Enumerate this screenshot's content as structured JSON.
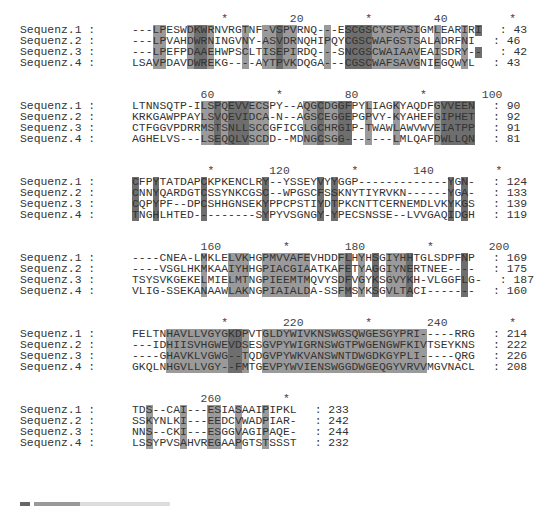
{
  "shade_colors": {
    "light": "#9a9a9a",
    "dark": "#6e6e6e"
  },
  "blocks": [
    {
      "ruler": "             *         20         *         40         *",
      "rows": [
        {
          "name": "Sequenz.1 :",
          "seq": "---LPESWDKWRNVRGTNF-VSPVRNQ---ESCGSCYSFASIGMLEARIRI",
          "end": ": 43"
        },
        {
          "name": "Sequenz.2 :",
          "seq": "---LPVAHDWRNINGVNY-ASVDRNQHIPQYCGSCWAFGSTSALADRFNI",
          "end": ": 46"
        },
        {
          "name": "Sequenz.3 :",
          "seq": "---LPEFPDAAEHWPSCLTISEPIRDQ---SNCGSCWAIAAVEAISDRY--",
          "end": ": 42"
        },
        {
          "name": "Sequenz.4 :",
          "seq": "LSAVPDAVDWREKG----AYTPVKDQGA---CGSCWAFSAVGNIEGQWYL",
          "end": ": 43"
        }
      ]
    },
    {
      "ruler": "          60         *         80         *        100",
      "rows": [
        {
          "name": "Sequenz.1 :",
          "seq": "LTNNSQTP-ILSPQEVVECSPY--AQGCDGGFPYLIAGKYAQDFGVVEEN",
          "end": ": 90"
        },
        {
          "name": "Sequenz.2 :",
          "seq": "KRKGAWPPAYLSVQEVIDCA-N--AGSCEGGEPGPVY-KYAHEFGIPHET",
          "end": ": 92"
        },
        {
          "name": "Sequenz.3 :",
          "seq": "CTFGGVPDRRMSTSNLLSCCGFICGLGCHRGIP-TWAWLAWVWVEIATPP",
          "end": ": 91"
        },
        {
          "name": "Sequenz.4 :",
          "seq": "AGHELVS---LSEQQLVSCDD--MDNGCSGG-------LMLQAFDWLLQN",
          "end": ": 81"
        }
      ]
    },
    {
      "ruler": "           *        120         *        140         *",
      "rows": [
        {
          "name": "Sequenz.1 :",
          "seq": "CFPYTATDAPCKPKENCLRY--YSSEYVYYGGP-------------YGN-",
          "end": ": 124"
        },
        {
          "name": "Sequenz.2 :",
          "seq": "CNNYQARDGTCSSYNKCGSC--WPGSCFSSKNYTIYRVKN------YGA-",
          "end": ": 133"
        },
        {
          "name": "Sequenz.3 :",
          "seq": "CQPYPF--DPCSHHGNSEKYPPCPSTIYDTPKCNTTCERNEMDLVKYKGS",
          "end": ": 139"
        },
        {
          "name": "Sequenz.4 :",
          "seq": "TNGHLHTED---------SYPYVSGNGY-YPECSNSSE--LVVGAQIDGH",
          "end": ": 119"
        }
      ]
    },
    {
      "ruler": "          160         *        180         *        200",
      "rows": [
        {
          "name": "Sequenz.1 :",
          "seq": "----CNEA-LMKLELVKHGPMVVAFEVHDDFLHYHSGIYHHTGLSDPFNP",
          "end": ": 169"
        },
        {
          "name": "Sequenz.2 :",
          "seq": "----VSGLHKMKAAIYHHGPIACGIAATKAFETYAGGIYNERTNEE----",
          "end": ": 175"
        },
        {
          "name": "Sequenz.3 :",
          "seq": "TSYSVKGEKELMIELMTNGPIEEMTMQVYSDFVGYKSGVYKH-VLGGFLG-",
          "end": ": 187"
        },
        {
          "name": "Sequenz.4 :",
          "seq": "VLIG-SSEKANAAWLAKNGPIAIALDA-SSFMSYKSGVLTACI-------",
          "end": ": 160"
        }
      ]
    },
    {
      "ruler": "             *        220         *        240         *",
      "rows": [
        {
          "name": "Sequenz.1 :",
          "seq": "FELTNHAVLLVGYGKDPVTGLDYWIVKNSWGSQWGESGYPRI-----RRG",
          "end": ": 214"
        },
        {
          "name": "Sequenz.2 :",
          "seq": "---IDHIISVHGWEVDSESGVPYWIGRNSWGTPWGENGWFKIVTSEYKNS",
          "end": ": 222"
        },
        {
          "name": "Sequenz.3 :",
          "seq": "----GHAVKLVGWG--TQDGVPYWKVANSWNTDWGDKGYPLI-----QRG",
          "end": ": 226"
        },
        {
          "name": "Sequenz.4 :",
          "seq": "GKQLNHGVLLVGY--FMTGEVPYWVIENSWGGDWGEQGYVRVVMGVNACL",
          "end": ": 208"
        }
      ]
    },
    {
      "ruler": "          260         *",
      "rows": [
        {
          "name": "Sequenz.1 :",
          "seq": "TDS--CAI---ESIASAAIPIPKL",
          "end": ": 233"
        },
        {
          "name": "Sequenz.2 :",
          "seq": "SSKYNLKI---EEDCVWADPIAR-",
          "end": ": 242"
        },
        {
          "name": "Sequenz.3 :",
          "seq": "NNS--CKI---ESGGVAGIPAQE-",
          "end": ": 244"
        },
        {
          "name": "Sequenz.4 :",
          "seq": "LSSYPVSAHVREGAAPGTSTSSST",
          "end": ": 232"
        }
      ]
    }
  ],
  "shading": [
    {
      "block": 0,
      "cols": {
        "light": [
          3,
          4,
          8,
          11,
          16,
          19,
          20,
          22,
          23,
          28,
          35,
          36,
          37,
          38,
          39,
          40,
          41,
          44,
          48
        ],
        "dark": [
          9,
          10,
          21,
          31,
          32,
          33,
          34,
          50
        ]
      }
    },
    {
      "block": 1,
      "cols": {
        "light": [
          10,
          11,
          13,
          17,
          18,
          19,
          25,
          26,
          28,
          29,
          34,
          38,
          44
        ],
        "dark": [
          12,
          14,
          15,
          16,
          27,
          30,
          31,
          45,
          46,
          47,
          48,
          49
        ]
      }
    },
    {
      "block": 2,
      "cols": {
        "light": [],
        "dark": [
          0,
          3,
          10,
          19,
          27,
          29,
          46,
          48
        ]
      }
    },
    {
      "block": 3,
      "cols": {
        "light": [
          10,
          14,
          15,
          16,
          19,
          20,
          21,
          22,
          23,
          24,
          25,
          30,
          33,
          37,
          38,
          39
        ],
        "dark": [
          31,
          35,
          40,
          48
        ]
      }
    },
    {
      "block": 4,
      "cols": {
        "light": [
          5,
          6,
          7,
          8,
          9,
          10,
          11,
          12,
          13,
          16,
          19,
          20,
          21,
          22,
          23,
          24,
          25,
          26,
          27,
          28,
          29,
          30,
          31,
          32,
          33,
          34,
          35,
          36,
          37,
          38,
          39,
          40,
          41,
          42
        ],
        "dark": [
          14,
          15
        ]
      }
    },
    {
      "block": 5,
      "cols": {
        "light": [
          2,
          7,
          11,
          12,
          15,
          19
        ],
        "dark": []
      }
    }
  ]
}
